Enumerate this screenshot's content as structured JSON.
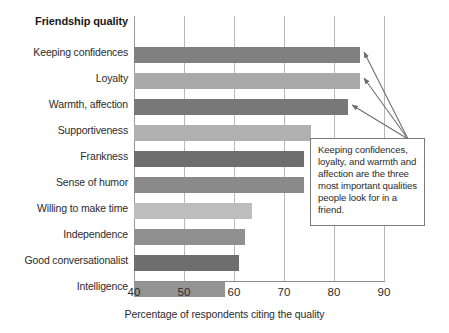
{
  "chart_data": {
    "type": "bar",
    "orientation": "horizontal",
    "title": "",
    "ylabel": "Friendship quality",
    "xlabel": "Percentage of respondents citing the quality",
    "xlim": [
      40,
      90
    ],
    "xticks": [
      40,
      50,
      60,
      70,
      80,
      90
    ],
    "grid": "vertical",
    "legend": "none",
    "categories": [
      "Keeping confidences",
      "Loyalty",
      "Warmth, affection",
      "Supportiveness",
      "Frankness",
      "Sense of humor",
      "Willing to make time",
      "Independence",
      "Good conversationalist",
      "Intelligence"
    ],
    "values": [
      85.2,
      85.2,
      82.8,
      75.3,
      74.0,
      74.0,
      63.6,
      62.3,
      60.9,
      58.3
    ],
    "bar_colors": [
      "#808080",
      "#a9a9a9",
      "#787878",
      "#b0b0b0",
      "#6e6e6e",
      "#8a8a8a",
      "#bdbdbd",
      "#909090",
      "#6e6e6e",
      "#949494"
    ],
    "annotations": [
      {
        "text": "Keeping confidences, loyalty, and warmth and affection are the three most important qualities people look for in a friend.",
        "points_to": [
          "Keeping confidences",
          "Loyalty",
          "Warmth, affection"
        ]
      }
    ]
  },
  "colors": {
    "gridline": "#b8b8b8",
    "axis": "#8c8c8c",
    "text": "#2b2b2b",
    "callout_border": "#7a7a7a",
    "arrow": "#6b6b6b"
  }
}
